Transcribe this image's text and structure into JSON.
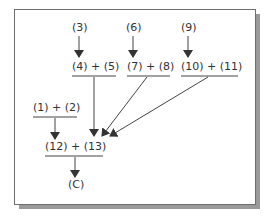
{
  "diagram": {
    "nodes": {
      "n3": "(3)",
      "n6": "(6)",
      "n9": "(9)",
      "sum45": "(4) + (5)",
      "sum78": "(7) + (8)",
      "sum1011": "(10) + (11)",
      "sum12": "(1) + (2)",
      "sum1213": "(12) + (13)",
      "result": "(C)"
    },
    "edges": [
      {
        "from": "(3)",
        "to": "(4) + (5)"
      },
      {
        "from": "(6)",
        "to": "(7) + (8)"
      },
      {
        "from": "(9)",
        "to": "(10) + (11)"
      },
      {
        "from": "(4) + (5)",
        "to": "(12) + (13)"
      },
      {
        "from": "(7) + (8)",
        "to": "(12) + (13)"
      },
      {
        "from": "(10) + (11)",
        "to": "(12) + (13)"
      },
      {
        "from": "(1) + (2)",
        "to": "(12) + (13)"
      },
      {
        "from": "(12) + (13)",
        "to": "(C)"
      }
    ],
    "colors": {
      "line": "#444444",
      "text": "#333333",
      "frame": "#6e6e6e",
      "shadow": "#9a9a9a"
    }
  }
}
